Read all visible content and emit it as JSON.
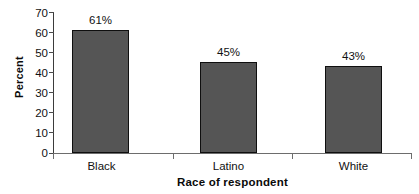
{
  "chart_data": {
    "type": "bar",
    "title": "",
    "categories": [
      "Black",
      "Latino",
      "White"
    ],
    "values": [
      61,
      45,
      43
    ],
    "data_labels": [
      "61%",
      "45%",
      "43%"
    ],
    "xlabel": "Race of respondent",
    "ylabel": "Percent",
    "ylim": [
      0,
      70
    ],
    "ytick_step": 10,
    "ytick_labels": [
      "70",
      "60",
      "50",
      "40",
      "30",
      "20",
      "10",
      "0"
    ],
    "ytick_values": [
      70,
      60,
      50,
      40,
      30,
      20,
      10,
      0
    ],
    "grid": false,
    "legend": false,
    "legend_position": "none",
    "series": [
      {
        "name": "Percent",
        "values": [
          61,
          45,
          43
        ]
      }
    ],
    "colors": {
      "bar_fill": "#555555",
      "bar_outline": "#0f0f0f",
      "axis": "#6d6d6d",
      "text": "#111111",
      "background": "#ffffff"
    }
  }
}
